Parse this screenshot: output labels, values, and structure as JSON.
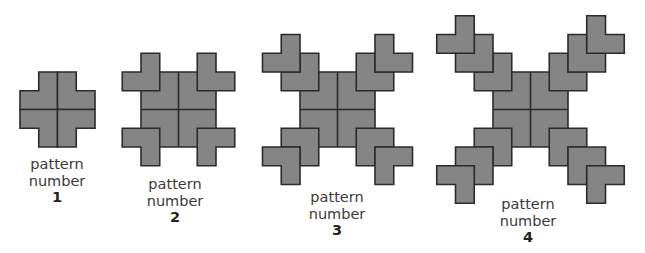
{
  "diagram": {
    "unit_px": 18.75,
    "colors": {
      "fill": "#858585",
      "stroke": "#2b2b2b",
      "text": "#3a3a3a"
    },
    "patterns": [
      {
        "number": "1",
        "line1": "pattern",
        "line2": "number",
        "center_x": 20,
        "center_y": 72,
        "corner_pieces": 0,
        "label_x": 7,
        "label_y": 156
      },
      {
        "number": "2",
        "line1": "pattern",
        "line2": "number",
        "center_x": 141,
        "center_y": 72,
        "corner_pieces": 1,
        "label_x": 125,
        "label_y": 176
      },
      {
        "number": "3",
        "line1": "pattern",
        "line2": "number",
        "center_x": 300,
        "center_y": 72,
        "corner_pieces": 2,
        "label_x": 287,
        "label_y": 189
      },
      {
        "number": "4",
        "line1": "pattern",
        "line2": "number",
        "center_x": 493,
        "center_y": 72,
        "corner_pieces": 3,
        "label_x": 478,
        "label_y": 196
      }
    ]
  }
}
